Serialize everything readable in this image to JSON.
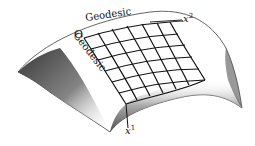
{
  "diagram": {
    "labels": {
      "top_geodesic": "Geodesic",
      "left_geodesic": "Geodesic",
      "origin": "O",
      "axis2_base": "x",
      "axis2_sup": "2",
      "axis1_base": "x",
      "axis1_sup": "1"
    },
    "grid": {
      "rows": 6,
      "cols": 7
    },
    "colors": {
      "ink": "#111111",
      "shade": "#555555",
      "background": "#ffffff"
    }
  }
}
